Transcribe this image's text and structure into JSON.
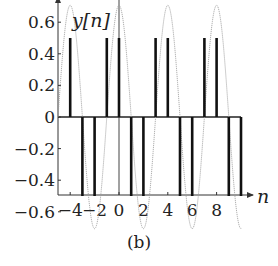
{
  "chart_data": {
    "type": "stem",
    "title": "",
    "xlabel": "n",
    "ylabel": "y[n]",
    "caption": "(b)",
    "x": [
      -4,
      -3,
      -2,
      -1,
      0,
      1,
      2,
      3,
      4,
      5,
      6,
      7,
      8,
      9,
      10
    ],
    "values": [
      0.5,
      -0.5,
      -0.5,
      0.5,
      0.5,
      -0.5,
      -0.5,
      0.5,
      0.5,
      -0.5,
      -0.5,
      0.5,
      0.5,
      -0.5,
      -0.5
    ],
    "envelope": {
      "description": "dotted continuous sinusoid",
      "amplitude": 0.707,
      "period": 4,
      "phase_offset_n": 0.5
    },
    "xticks": [
      -4,
      -2,
      0,
      2,
      4,
      6,
      8
    ],
    "xtick_labels": [
      "−4",
      "−2",
      "0",
      "2",
      "4",
      "6",
      "8"
    ],
    "yticks": [
      -0.6,
      -0.4,
      -0.2,
      0,
      0.2,
      0.4,
      0.6
    ],
    "ytick_labels": [
      "−0.6",
      "−0.4",
      "−0.2",
      "0",
      "0.2",
      "0.4",
      "0.6"
    ],
    "xlim": [
      -5,
      11
    ],
    "ylim": [
      -0.75,
      0.75
    ],
    "grid": false,
    "legend": null
  },
  "labels": {
    "ylabel": "y[n]",
    "xlabel": "n",
    "caption": "(b)"
  }
}
